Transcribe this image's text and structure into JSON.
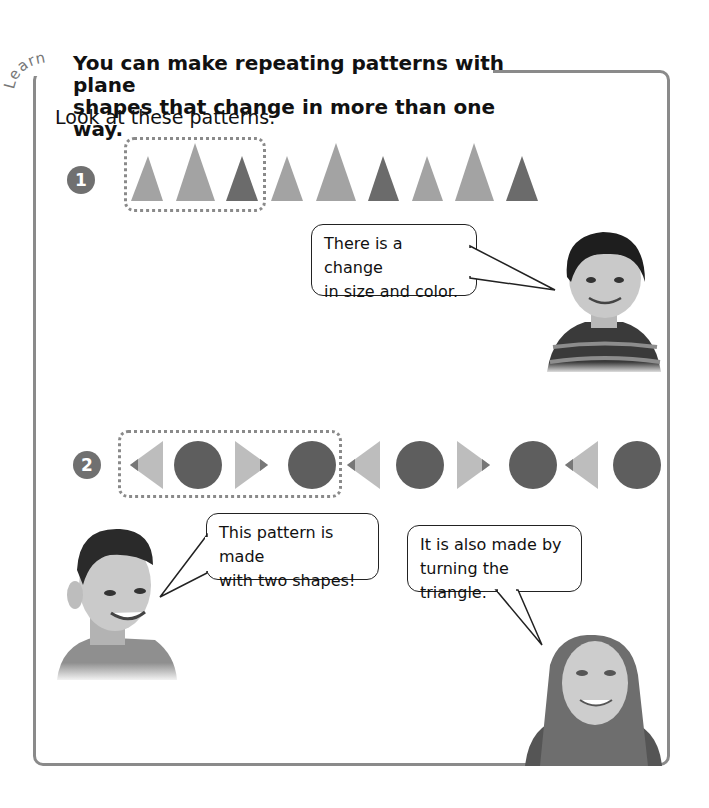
{
  "lesson": {
    "section_label": "Learn",
    "headline_line1": "You can make repeating patterns with plane",
    "headline_line2": "shapes that change in more than one way.",
    "intro": "Look at these patterns."
  },
  "patterns": [
    {
      "number": "1",
      "description": "triangles changing in size and color",
      "repeating_unit": [
        "small light triangle",
        "large light triangle",
        "small dark triangle"
      ],
      "shapes": [
        {
          "type": "triangle",
          "size": "small",
          "shade": "light"
        },
        {
          "type": "triangle",
          "size": "large",
          "shade": "light"
        },
        {
          "type": "triangle",
          "size": "small",
          "shade": "dark"
        },
        {
          "type": "triangle",
          "size": "small",
          "shade": "light"
        },
        {
          "type": "triangle",
          "size": "large",
          "shade": "light"
        },
        {
          "type": "triangle",
          "size": "small",
          "shade": "dark"
        },
        {
          "type": "triangle",
          "size": "small",
          "shade": "light"
        },
        {
          "type": "triangle",
          "size": "large",
          "shade": "light"
        },
        {
          "type": "triangle",
          "size": "small",
          "shade": "dark"
        }
      ]
    },
    {
      "number": "2",
      "description": "triangles turning, alternating with circles",
      "repeating_unit": [
        "left-pointing triangle",
        "circle",
        "right-pointing triangle",
        "circle"
      ],
      "shapes": [
        {
          "type": "triangle",
          "direction": "left"
        },
        {
          "type": "circle"
        },
        {
          "type": "triangle",
          "direction": "right"
        },
        {
          "type": "circle"
        },
        {
          "type": "triangle",
          "direction": "left"
        },
        {
          "type": "circle"
        },
        {
          "type": "triangle",
          "direction": "right"
        },
        {
          "type": "circle"
        },
        {
          "type": "triangle",
          "direction": "left"
        },
        {
          "type": "circle"
        }
      ]
    }
  ],
  "speech_bubbles": [
    {
      "speaker": "boy with striped shirt",
      "line1": "There is a change",
      "line2": "in size and color."
    },
    {
      "speaker": "smiling boy",
      "line1": "This pattern is made",
      "line2": "with two shapes!"
    },
    {
      "speaker": "girl with long hair",
      "line1": "It is also made by",
      "line2": "turning the triangle."
    }
  ],
  "colors": {
    "frame": "#8a8a8a",
    "light_shape": "#a3a3a3",
    "dark_shape": "#6b6b6b",
    "light_triangle_p2": "#bdbdbd",
    "circle": "#5e5e5e",
    "badge": "#707070"
  }
}
